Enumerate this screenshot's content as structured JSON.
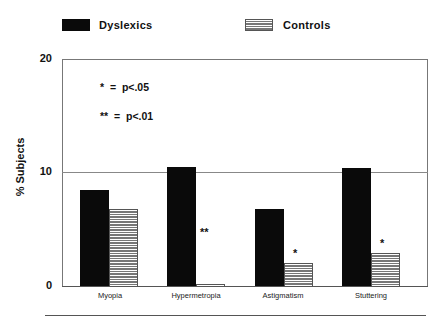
{
  "legend": {
    "items": [
      {
        "label": "Dyslexics",
        "style": "solid",
        "color": "#0a0a0a"
      },
      {
        "label": "Controls",
        "style": "horizontal-hatch",
        "color": "#777777"
      }
    ]
  },
  "axes": {
    "y_label": "% Subjects",
    "y_ticks": [
      "20",
      "10",
      "0"
    ]
  },
  "annotations": {
    "sig1": "*  =  p<.05",
    "sig2": "**  =  p<.01"
  },
  "categories": [
    "Myopia",
    "Hypermetropia",
    "Astigmatism",
    "Stuttering"
  ],
  "significance_marks": [
    "",
    "**",
    "*",
    "*"
  ],
  "chart_data": {
    "type": "bar",
    "title": "",
    "xlabel": "",
    "ylabel": "% Subjects",
    "ylim": [
      0,
      20
    ],
    "yticks": [
      0,
      10,
      20
    ],
    "grid": "horizontal line at 10",
    "legend_position": "top",
    "categories": [
      "Myopia",
      "Hypermetropia",
      "Astigmatism",
      "Stuttering"
    ],
    "series": [
      {
        "name": "Dyslexics",
        "values": [
          8.5,
          10.5,
          6.8,
          10.4
        ]
      },
      {
        "name": "Controls",
        "values": [
          6.8,
          0.2,
          2.0,
          2.9
        ]
      }
    ],
    "annotations": [
      "* = p<.05",
      "** = p<.01",
      "Hypermetropia: **",
      "Astigmatism: *",
      "Stuttering: *"
    ]
  }
}
